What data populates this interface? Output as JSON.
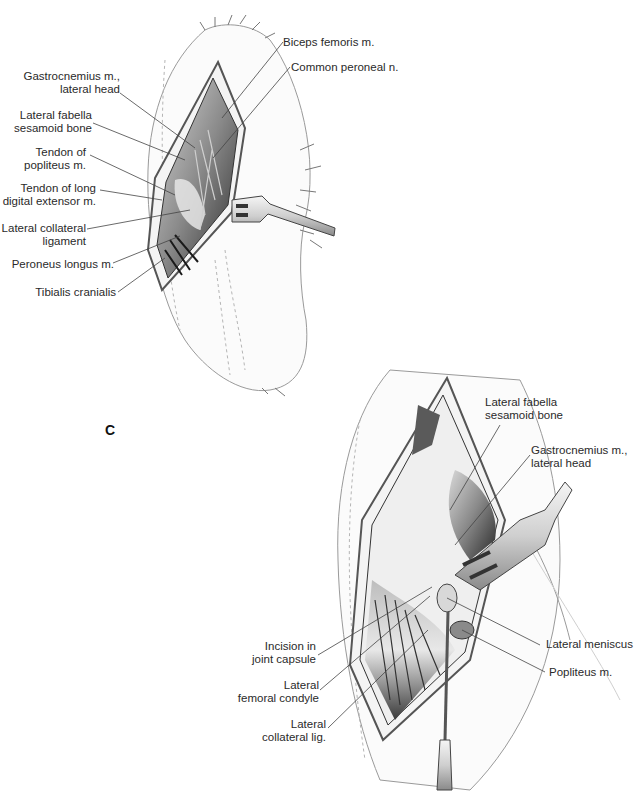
{
  "figure": {
    "panel_letter": "C",
    "top_view": {
      "labels": [
        {
          "id": "gastrocnemius",
          "line1": "Gastrocnemius m.,",
          "line2": "lateral head"
        },
        {
          "id": "fabella",
          "line1": "Lateral fabella",
          "line2": "sesamoid bone"
        },
        {
          "id": "tendon-popliteus",
          "line1": "Tendon of",
          "line2": "popliteus m."
        },
        {
          "id": "tendon-long-digital",
          "line1": "Tendon of long",
          "line2": "digital extensor m."
        },
        {
          "id": "lateral-collateral",
          "line1": "Lateral collateral",
          "line2": "ligament"
        },
        {
          "id": "peroneus-longus",
          "line1": "Peroneus longus m.",
          "line2": ""
        },
        {
          "id": "tibialis-cranialis",
          "line1": "Tibialis cranialis",
          "line2": ""
        },
        {
          "id": "biceps-femoris",
          "line1": "Biceps femoris m.",
          "line2": ""
        },
        {
          "id": "common-peroneal",
          "line1": "Common peroneal n.",
          "line2": ""
        }
      ]
    },
    "bottom_view": {
      "labels": [
        {
          "id": "fabella",
          "line1": "Lateral fabella",
          "line2": "sesamoid bone"
        },
        {
          "id": "gastrocnemius",
          "line1": "Gastrocnemius m.,",
          "line2": "lateral head"
        },
        {
          "id": "lateral-meniscus",
          "line1": "Lateral meniscus",
          "line2": ""
        },
        {
          "id": "popliteus",
          "line1": "Popliteus m.",
          "line2": ""
        },
        {
          "id": "incision",
          "line1": "Incision in",
          "line2": "joint capsule"
        },
        {
          "id": "femoral-condyle",
          "line1": "Lateral",
          "line2": "femoral condyle"
        },
        {
          "id": "collateral-lig",
          "line1": "Lateral",
          "line2": "collateral lig."
        }
      ]
    }
  }
}
